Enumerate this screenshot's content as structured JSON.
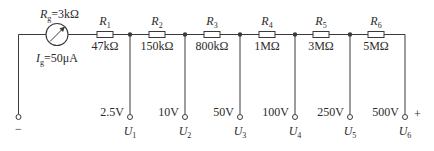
{
  "galvanometer": {
    "resistance_symbol": "R",
    "resistance_sub": "g",
    "resistance_value": "=3kΩ",
    "current_symbol": "I",
    "current_sub": "g",
    "current_value": "=50μA"
  },
  "resistors": [
    {
      "symbol": "R",
      "sub": "1",
      "value": "47kΩ"
    },
    {
      "symbol": "R",
      "sub": "2",
      "value": "150kΩ"
    },
    {
      "symbol": "R",
      "sub": "3",
      "value": "800kΩ"
    },
    {
      "symbol": "R",
      "sub": "4",
      "value": "1MΩ"
    },
    {
      "symbol": "R",
      "sub": "5",
      "value": "3MΩ"
    },
    {
      "symbol": "R",
      "sub": "6",
      "value": "5MΩ"
    }
  ],
  "terminals": [
    {
      "range": "2.5V",
      "symbol": "U",
      "sub": "1"
    },
    {
      "range": "10V",
      "symbol": "U",
      "sub": "2"
    },
    {
      "range": "50V",
      "symbol": "U",
      "sub": "3"
    },
    {
      "range": "100V",
      "symbol": "U",
      "sub": "4"
    },
    {
      "range": "250V",
      "symbol": "U",
      "sub": "5"
    },
    {
      "range": "500V",
      "symbol": "U",
      "sub": "6"
    }
  ],
  "common_terminal": {
    "sign": "−"
  },
  "positive_sign": "+",
  "colors": {
    "line": "#3a3a3a",
    "text": "#2b2b2b",
    "background": "#ffffff"
  }
}
